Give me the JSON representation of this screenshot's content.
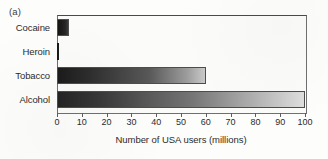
{
  "figure": {
    "panel_label": "(a)"
  },
  "chart_data": {
    "type": "bar",
    "orientation": "horizontal",
    "title": "",
    "xlabel": "Number of USA users (millions)",
    "ylabel": "",
    "categories": [
      "Cocaine",
      "Heroin",
      "Tobacco",
      "Alcohol"
    ],
    "values": [
      5,
      1,
      60,
      100
    ],
    "xlim": [
      0,
      100
    ],
    "xticks": [
      0,
      10,
      20,
      30,
      40,
      50,
      60,
      70,
      80,
      90,
      100
    ],
    "xtick_labels": [
      "0",
      "10",
      "20",
      "30",
      "40",
      "50",
      "60",
      "70",
      "80",
      "90",
      "100"
    ],
    "grid": false,
    "legend": "none",
    "bar_style": "grayscale dark-to-light horizontal gradient",
    "colors": {
      "bar_dark": "#1b1b1b",
      "bar_light": "#dedede",
      "frame": "#6f6f6f",
      "text": "#2b2b2b",
      "background": "#fbfbfa"
    }
  }
}
